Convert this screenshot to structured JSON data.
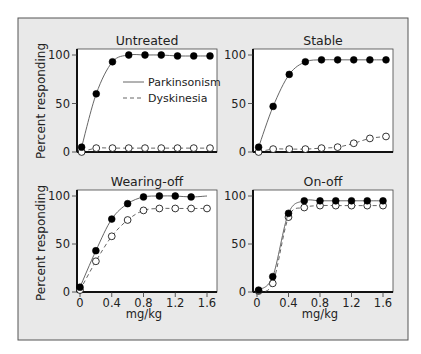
{
  "figure": {
    "background": "#e9e9e9",
    "border_color": "#555555",
    "ylabel": "Percent responding",
    "xlabel": "mg/kg",
    "legend": [
      {
        "label": "Parkinsonism",
        "style": "solid"
      },
      {
        "label": "Dyskinesia",
        "style": "dashed"
      }
    ]
  },
  "chart_data": [
    {
      "type": "line",
      "title": "Untreated",
      "xlabel": "",
      "ylabel": "Percent responding",
      "ylim": [
        0,
        100
      ],
      "yticks": [
        0,
        50,
        100
      ],
      "xticks": [],
      "grid": false,
      "legend_position": "inside right",
      "x": [
        0.02,
        0.2,
        0.4,
        0.6,
        0.8,
        1.0,
        1.2,
        1.4,
        1.6
      ],
      "series": [
        {
          "name": "Parkinsonism",
          "values": [
            5,
            60,
            93,
            100,
            100,
            100,
            99,
            99,
            99
          ]
        },
        {
          "name": "Dyskinesia",
          "values": [
            0,
            4,
            4,
            4,
            4,
            4,
            4,
            4,
            4
          ]
        }
      ]
    },
    {
      "type": "line",
      "title": "Stable",
      "xlabel": "",
      "ylabel": "",
      "ylim": [
        0,
        100
      ],
      "yticks": [
        0,
        50,
        100
      ],
      "xticks": [],
      "grid": false,
      "x": [
        0.02,
        0.2,
        0.4,
        0.6,
        0.8,
        1.0,
        1.2,
        1.4,
        1.6
      ],
      "series": [
        {
          "name": "Parkinsonism",
          "values": [
            5,
            47,
            80,
            93,
            95,
            95,
            95,
            95,
            95
          ]
        },
        {
          "name": "Dyskinesia",
          "values": [
            0,
            3,
            3,
            3,
            4,
            5,
            9,
            14,
            16
          ]
        }
      ]
    },
    {
      "type": "line",
      "title": "Wearing-off",
      "xlabel": "mg/kg",
      "ylabel": "Percent responding",
      "ylim": [
        0,
        100
      ],
      "yticks": [
        0,
        50,
        100
      ],
      "xticks": [
        "0",
        "0.4",
        "0.8",
        "1.2",
        "1.6"
      ],
      "grid": false,
      "x": [
        0.0,
        0.2,
        0.4,
        0.6,
        0.8,
        1.0,
        1.2,
        1.4,
        1.6
      ],
      "series": [
        {
          "name": "Parkinsonism",
          "values": [
            5,
            43,
            76,
            92,
            99,
            100,
            100,
            99,
            null
          ]
        },
        {
          "name": "Dyskinesia",
          "values": [
            2,
            32,
            58,
            75,
            85,
            87,
            87,
            87,
            87
          ]
        }
      ]
    },
    {
      "type": "line",
      "title": "On-off",
      "xlabel": "mg/kg",
      "ylabel": "",
      "ylim": [
        0,
        100
      ],
      "yticks": [
        0,
        50,
        100
      ],
      "xticks": [
        "0",
        "0.4",
        "0.8",
        "1.2",
        "1.6"
      ],
      "grid": false,
      "x": [
        0.02,
        0.2,
        0.4,
        0.6,
        0.8,
        1.0,
        1.2,
        1.4,
        1.6
      ],
      "series": [
        {
          "name": "Parkinsonism",
          "values": [
            2,
            16,
            82,
            95,
            95,
            95,
            95,
            95,
            95
          ]
        },
        {
          "name": "Dyskinesia",
          "values": [
            1,
            9,
            78,
            88,
            90,
            90,
            90,
            90,
            90
          ]
        }
      ]
    }
  ]
}
